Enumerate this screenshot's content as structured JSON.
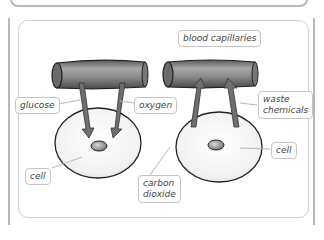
{
  "diagram": {
    "title_labels": {
      "blood_capillaries": "blood capillaries"
    },
    "left": {
      "glucose": "glucose",
      "oxygen": "oxygen",
      "cell": "cell"
    },
    "right": {
      "waste_line1": "waste",
      "waste_line2": "chemicals",
      "carbon_line1": "carbon",
      "carbon_line2": "dioxide",
      "cell": "cell"
    },
    "colors": {
      "frame": "#b8b8b8",
      "panel_border": "#cfcfcf",
      "tube_fill": "#8a8a8a",
      "arrow_fill": "#6f6f6f",
      "cell_fill": "#f4f4f4",
      "label_border": "#c4c4c4"
    }
  }
}
